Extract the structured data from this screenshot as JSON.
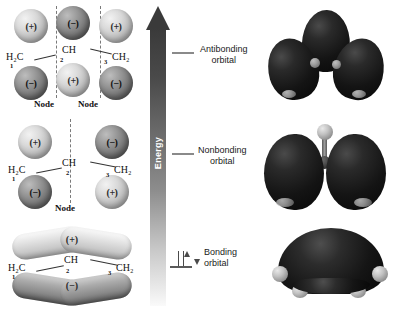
{
  "figure": {
    "background_color": "#ffffff"
  },
  "energy_axis": {
    "label": "Energy",
    "direction": "up",
    "arrow_color": "#3a3a3a"
  },
  "levels": [
    {
      "id": "antibonding",
      "label_line1": "Antibonding",
      "label_line2": "orbital",
      "electrons": 0,
      "tick_color": "#8a8a8a"
    },
    {
      "id": "nonbonding",
      "label_line1": "Nonbonding",
      "label_line2": "orbital",
      "electrons": 0,
      "tick_color": "#8a8a8a"
    },
    {
      "id": "bonding",
      "label_line1": "Bonding",
      "label_line2": "orbital",
      "electrons": 2,
      "tick_color": "#5a5a5a"
    }
  ],
  "orbitals": [
    {
      "id": "antibonding",
      "skeleton": {
        "left": "H₂C",
        "center": "CH",
        "right": "CH₂",
        "num_left": "1",
        "num_center": "2",
        "num_right": "3"
      },
      "lobes_top": [
        "(+)",
        "(−)",
        "(+)"
      ],
      "lobes_bottom": [
        "(−)",
        "(+)",
        "(−)"
      ],
      "lobe_shades_top": [
        "light",
        "dark",
        "light"
      ],
      "lobe_shades_bottom": [
        "dark",
        "light",
        "dark"
      ],
      "nodes": [
        "Node",
        "Node"
      ],
      "node_count": 2
    },
    {
      "id": "nonbonding",
      "skeleton": {
        "left": "H₂C",
        "center": "CH",
        "right": "CH₂",
        "num_left": "1",
        "num_center": "2",
        "num_right": "3"
      },
      "lobes_top": [
        "(+)",
        "(−)"
      ],
      "lobes_bottom": [
        "(−)",
        "(+)"
      ],
      "lobe_shades_top": [
        "light",
        "dark"
      ],
      "lobe_shades_bottom": [
        "dark",
        "light"
      ],
      "nodes": [
        "Node"
      ],
      "node_count": 1
    },
    {
      "id": "bonding",
      "skeleton": {
        "left": "H₂C",
        "center": "CH",
        "right": "CH₂",
        "num_left": "1",
        "num_center": "2",
        "num_right": "3"
      },
      "lobe_top_sign": "(+)",
      "lobe_bottom_sign": "(−)",
      "nodes": [],
      "node_count": 0
    }
  ],
  "models": [
    {
      "id": "antibonding-model",
      "description": "three-lobe-space-filling-model",
      "lobe_count": 3,
      "hydrogen_count": 0,
      "surface_color": "#141414"
    },
    {
      "id": "nonbonding-model",
      "description": "two-lobe-space-filling-model",
      "lobe_count": 2,
      "hydrogen_count": 1,
      "surface_color": "#141414"
    },
    {
      "id": "bonding-model",
      "description": "single-dome-space-filling-model",
      "lobe_count": 1,
      "hydrogen_count": 4,
      "surface_color": "#141414"
    }
  ]
}
